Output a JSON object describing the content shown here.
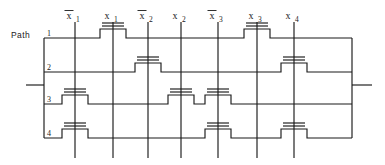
{
  "figure": {
    "title": "",
    "path_label": "Path",
    "colors": {
      "ink": "#1a1a1a",
      "background": "#ffffff"
    }
  },
  "columns": [
    {
      "id": "xb1",
      "label": "x",
      "subscript": "1",
      "negated": true,
      "x": 75
    },
    {
      "id": "x1",
      "label": "x",
      "subscript": "1",
      "negated": false,
      "x": 113
    },
    {
      "id": "xb2",
      "label": "x",
      "subscript": "2",
      "negated": true,
      "x": 148
    },
    {
      "id": "x2",
      "label": "x",
      "subscript": "2",
      "negated": false,
      "x": 181
    },
    {
      "id": "xb3",
      "label": "x",
      "subscript": "3",
      "negated": true,
      "x": 218
    },
    {
      "id": "x3",
      "label": "x",
      "subscript": "3",
      "negated": false,
      "x": 257
    },
    {
      "id": "x4",
      "label": "x",
      "subscript": "4",
      "negated": false,
      "x": 294
    }
  ],
  "rows": [
    {
      "id": "path-1",
      "label": "1",
      "y": 38,
      "transistors": [
        "x1",
        "x3"
      ]
    },
    {
      "id": "path-2",
      "label": "2",
      "y": 72,
      "transistors": [
        "xb2",
        "x4"
      ]
    },
    {
      "id": "path-3",
      "label": "3",
      "y": 104,
      "transistors": [
        "xb1",
        "x2",
        "xb3"
      ]
    },
    {
      "id": "path-4",
      "label": "4",
      "y": 138,
      "transistors": [
        "xb1",
        "xb3",
        "x4"
      ]
    }
  ],
  "terminals": {
    "left": {
      "name": "input-terminal",
      "x1": 26,
      "x2": 44,
      "y": 85
    },
    "right": {
      "name": "output-terminal",
      "x1": 352,
      "x2": 372,
      "y": 85
    }
  },
  "frame": {
    "left": 44,
    "right": 352,
    "top": 38,
    "bottom": 138
  },
  "geometry": {
    "column_top": 22,
    "column_bottom": 158,
    "transistor_half_width": 13,
    "transistor_step_height": 9,
    "gate_bar_half_width": 11,
    "gate_bar_gap": 3
  }
}
